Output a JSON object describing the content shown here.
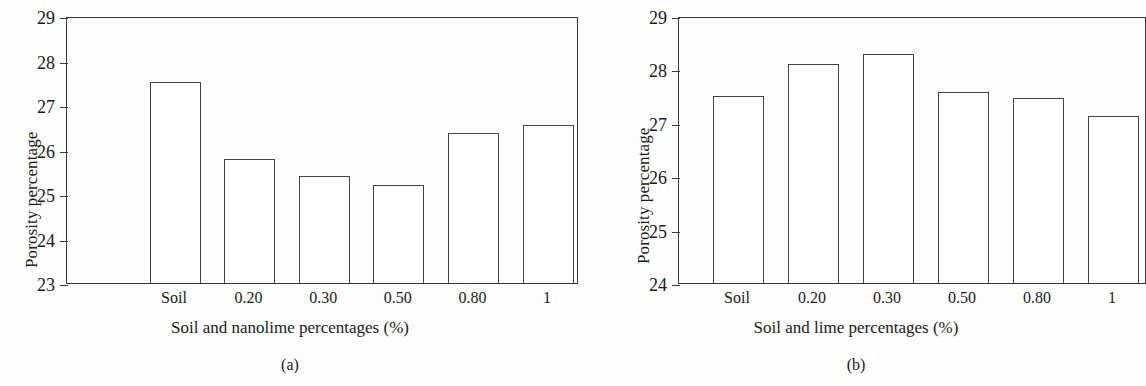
{
  "figure": {
    "background": "#fdfdfd",
    "line_color": "#3a3a3a",
    "bar_fill": "#ffffff",
    "bar_edge": "#444444"
  },
  "panels": [
    {
      "caption": "(a)",
      "ylabel": "Porosity percentage",
      "xlabel": "Soil and nanolime percentages (%)"
    },
    {
      "caption": "(b)",
      "ylabel": "Porosity percentage",
      "xlabel": "Soil and lime percentages (%)"
    }
  ],
  "chart_data": [
    {
      "type": "bar",
      "panel": "(a)",
      "title": "",
      "xlabel": "Soil and nanolime percentages (%)",
      "ylabel": "Porosity percentage",
      "categories": [
        "Soil",
        "0.20",
        "0.30",
        "0.50",
        "0.80",
        "1"
      ],
      "values": [
        27.52,
        25.78,
        25.4,
        25.2,
        26.38,
        26.55
      ],
      "ylim": [
        23,
        29
      ],
      "yticks": [
        "23",
        "24",
        "25",
        "26",
        "27",
        "28",
        "29"
      ],
      "ytick_values": [
        23,
        24,
        25,
        26,
        27,
        28,
        29
      ],
      "grid": false,
      "legend": false
    },
    {
      "type": "bar",
      "panel": "(b)",
      "title": "",
      "xlabel": "Soil and lime percentages (%)",
      "ylabel": "Porosity percentage",
      "categories": [
        "Soil",
        "0.20",
        "0.30",
        "0.50",
        "0.80",
        "1"
      ],
      "values": [
        27.5,
        28.1,
        28.28,
        27.57,
        27.47,
        27.13
      ],
      "ylim": [
        24,
        29
      ],
      "yticks": [
        "24",
        "25",
        "26",
        "27",
        "28",
        "29"
      ],
      "ytick_values": [
        24,
        25,
        26,
        27,
        28,
        29
      ],
      "grid": false,
      "legend": false
    }
  ]
}
